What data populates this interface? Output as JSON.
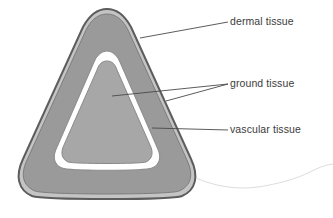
{
  "figure": {
    "background_color": "#ffffff"
  },
  "diagram": {
    "shape": "rounded-triangle-cross-section",
    "layers": [
      {
        "name": "outer-outline",
        "role": "epidermis outline",
        "color": "#5d5d5d",
        "description": "dark outer boundary line of the cross-section"
      },
      {
        "name": "dermal-band",
        "role": "dermal tissue",
        "color": "#c4c4c4",
        "description": "light gray band just inside the outer outline"
      },
      {
        "name": "cortex-body",
        "role": "ground tissue (outer)",
        "color": "#9a9a9a",
        "description": "large medium-gray region filling most of the section"
      },
      {
        "name": "vascular-ring",
        "role": "vascular tissue",
        "color": "#ffffff",
        "description": "white ring separating outer and inner ground tissue"
      },
      {
        "name": "pith-core",
        "role": "ground tissue (inner)",
        "color": "#a7a7a7",
        "description": "inner rounded-triangle core region"
      }
    ]
  },
  "labels": [
    {
      "id": "dermal",
      "text": "dermal tissue",
      "color": "#3b3b3b",
      "leader": {
        "from_x": 228,
        "from_y": 22,
        "to_x": 140,
        "to_y": 38
      }
    },
    {
      "id": "ground",
      "text": "ground tissue",
      "color": "#3b3b3b",
      "leaders": [
        {
          "from_x": 228,
          "from_y": 84,
          "to_x": 112,
          "to_y": 96
        },
        {
          "from_x": 228,
          "from_y": 84,
          "to_x": 166,
          "to_y": 101
        }
      ]
    },
    {
      "id": "vascular",
      "text": "vascular tissue",
      "color": "#3b3b3b",
      "leader": {
        "from_x": 228,
        "from_y": 130,
        "to_x": 152,
        "to_y": 128
      }
    }
  ],
  "artifacts": {
    "scan_line": {
      "name": "page-edge-scan-artifact",
      "color": "#d8d8d8",
      "description": "faint wavy gray line along the lower right, a scanned page edge"
    }
  }
}
